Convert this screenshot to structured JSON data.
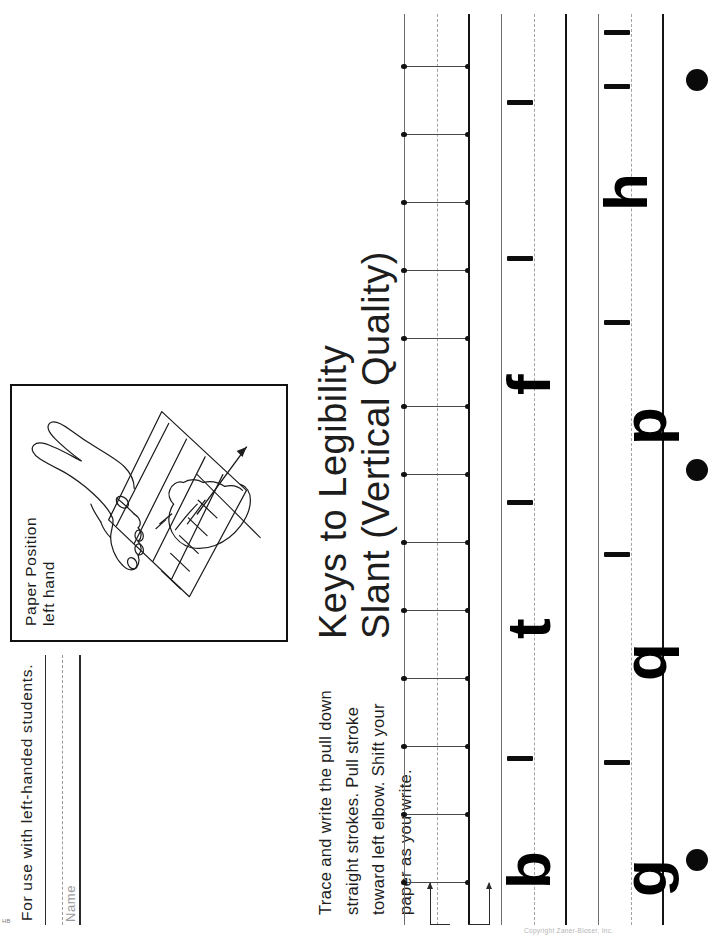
{
  "page": {
    "orientation": "landscape-content-rotated-90-ccw",
    "background": "#ffffff",
    "ink": "#1a1a1a"
  },
  "header": {
    "use_note": "For use with left-handed students.",
    "name_label": "Name"
  },
  "paper_position": {
    "caption_line1": "Paper Position",
    "caption_line2": "left hand",
    "illustration": "left-handed-writing-hands-on-slanted-paper-diagram"
  },
  "title": {
    "line1": "Keys to Legibility",
    "line2": "Slant (Vertical Quality)"
  },
  "instructions": {
    "text": "Trace and write the pull down straight strokes. Pull stroke toward left elbow. Shift your paper as you write."
  },
  "practice_rows": [
    {
      "index": 1,
      "kind": "trace-strokes",
      "stroke_count": 13,
      "letters": [],
      "has_start_arrows": true,
      "lines": {
        "baseline": "solid",
        "midline": "dashed",
        "topline": "solid-light"
      }
    },
    {
      "index": 2,
      "kind": "letters",
      "letters": [
        "b",
        "t",
        "f"
      ],
      "dash_marks": 4,
      "has_start_arrows": false,
      "lines": {
        "baseline": "solid",
        "midline": "dashed",
        "topline": "solid-light"
      }
    },
    {
      "index": 3,
      "kind": "letters",
      "letters": [
        "g",
        "q",
        "p",
        "h"
      ],
      "dash_marks": 5,
      "has_start_arrows": false,
      "lines": {
        "baseline": "solid",
        "midline": "dashed",
        "topline": "solid-light"
      }
    }
  ],
  "punch_holes": {
    "count": 3,
    "color": "#0a0a0a"
  },
  "footer": {
    "left_mark": "HB",
    "right_mark": "Copyright  Zaner-Bloser, Inc."
  },
  "colors": {
    "baseline": "#141414",
    "midline": "#a2a2a2",
    "topline": "#6d6d6d",
    "letter": "#000000",
    "name_label": "#9b9b9b"
  }
}
